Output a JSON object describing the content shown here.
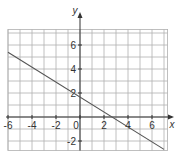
{
  "chart_data": {
    "type": "line",
    "title": "",
    "xlabel": "x",
    "ylabel": "y",
    "xlim": [
      -6,
      7.3
    ],
    "ylim": [
      -2.8,
      7.3
    ],
    "grid": true,
    "grid_step": 1,
    "x_ticks": [
      -6,
      -4,
      -2,
      0,
      2,
      4,
      6
    ],
    "x_tick_labels": [
      "-6",
      "-4",
      "-2",
      "0",
      "2",
      "4",
      "6"
    ],
    "y_ticks": [
      -2,
      2,
      4,
      6
    ],
    "y_tick_labels": [
      "-2",
      "2",
      "4",
      "6"
    ],
    "series": [
      {
        "name": "line",
        "color": "#555555",
        "points": [
          [
            -6,
            5.4
          ],
          [
            7,
            -2.7
          ]
        ]
      }
    ]
  },
  "colors": {
    "grid": "#b0b0b0",
    "axis": "#333333",
    "line": "#555555",
    "background": "#ffffff"
  }
}
